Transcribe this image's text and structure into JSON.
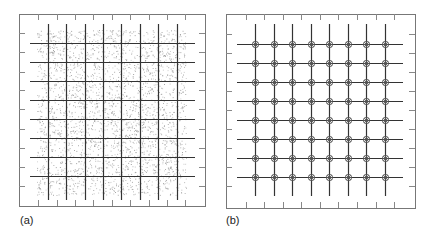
{
  "figure": {
    "panels": [
      {
        "id": "a",
        "caption": "(a)",
        "frame": {
          "x": 19,
          "y": 14,
          "w": 186,
          "h": 192
        },
        "grid": {
          "vertical_x": [
            48,
            66,
            85,
            103,
            121,
            140,
            158,
            177
          ],
          "vertical_y_range": [
            24,
            200
          ],
          "horizontal_y": [
            43,
            62,
            81,
            100,
            119,
            138,
            157,
            176
          ],
          "horizontal_x_range": [
            30,
            195
          ]
        },
        "ticks": {
          "top_bottom_x": [
            38,
            57,
            75,
            93,
            112,
            130,
            149,
            167,
            185
          ],
          "left_right_y": [
            33,
            52,
            72,
            90,
            109,
            129,
            148,
            167,
            186
          ],
          "length": 6
        },
        "stipple_region": {
          "x": 37,
          "y": 30,
          "w": 149,
          "h": 165
        },
        "fill_style": "stippled-dots"
      },
      {
        "id": "b",
        "caption": "(b)",
        "frame": {
          "x": 226,
          "y": 14,
          "w": 189,
          "h": 194
        },
        "grid": {
          "vertical_x": [
            255,
            274,
            292,
            311,
            329,
            348,
            366,
            385
          ],
          "vertical_y_range": [
            24,
            196
          ],
          "horizontal_y": [
            44,
            63,
            82,
            101,
            120,
            139,
            158,
            177
          ],
          "horizontal_x_range": [
            237,
            403
          ]
        },
        "ticks": {
          "top_bottom_x": [
            246,
            264,
            283,
            301,
            320,
            338,
            357,
            376,
            394
          ],
          "left_right_y": [
            34,
            53,
            72,
            91,
            110,
            129,
            148,
            167,
            186
          ],
          "length": 6
        },
        "marker": "circle-star-at-intersections"
      }
    ]
  },
  "colors": {
    "frame": "#777777",
    "grid_line": "#333333",
    "tick": "#888888",
    "stipple": "#888888",
    "marker": "#555555"
  }
}
